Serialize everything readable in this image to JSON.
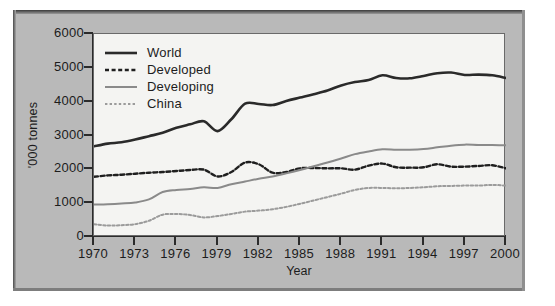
{
  "chart_data": {
    "type": "line",
    "title": "",
    "xlabel": "Year",
    "ylabel": "'000 tonnes",
    "xlim": [
      1970,
      2000
    ],
    "ylim": [
      0,
      6000
    ],
    "grid": false,
    "legend_position": "top-left",
    "x_ticks": [
      "1970",
      "1973",
      "1976",
      "1979",
      "1982",
      "1985",
      "1988",
      "1991",
      "1994",
      "1997",
      "2000"
    ],
    "y_ticks": [
      "0",
      "1000",
      "2000",
      "3000",
      "4000",
      "5000",
      "6000"
    ],
    "x": [
      1970,
      1971,
      1972,
      1973,
      1974,
      1975,
      1976,
      1977,
      1978,
      1979,
      1980,
      1981,
      1982,
      1983,
      1984,
      1985,
      1986,
      1987,
      1988,
      1989,
      1990,
      1991,
      1992,
      1993,
      1994,
      1995,
      1996,
      1997,
      1998,
      1999,
      2000
    ],
    "series": [
      {
        "name": "World",
        "style": "solid",
        "color": "#2a2a2a",
        "width": 2.6,
        "values": [
          2680,
          2760,
          2800,
          2880,
          2980,
          3080,
          3230,
          3330,
          3420,
          3130,
          3480,
          3940,
          3930,
          3900,
          4020,
          4120,
          4220,
          4330,
          4480,
          4580,
          4640,
          4780,
          4700,
          4690,
          4760,
          4840,
          4860,
          4790,
          4800,
          4780,
          4700
        ]
      },
      {
        "name": "Developed",
        "style": "dashed",
        "color": "#1f1f1f",
        "width": 2.4,
        "values": [
          1780,
          1820,
          1840,
          1870,
          1900,
          1920,
          1950,
          1980,
          1990,
          1790,
          1920,
          2200,
          2150,
          1900,
          1920,
          2030,
          2040,
          2030,
          2030,
          1990,
          2110,
          2170,
          2060,
          2050,
          2060,
          2150,
          2080,
          2080,
          2100,
          2120,
          2030
        ]
      },
      {
        "name": "Developing",
        "style": "solid",
        "color": "#8a8a8a",
        "width": 2.0,
        "values": [
          960,
          970,
          990,
          1020,
          1110,
          1330,
          1390,
          1420,
          1470,
          1450,
          1560,
          1640,
          1720,
          1790,
          1880,
          1980,
          2090,
          2200,
          2320,
          2450,
          2530,
          2590,
          2580,
          2580,
          2600,
          2650,
          2700,
          2730,
          2720,
          2720,
          2710
        ]
      },
      {
        "name": "China",
        "style": "dotted",
        "color": "#9b9b9b",
        "width": 2.0,
        "values": [
          380,
          340,
          350,
          380,
          480,
          660,
          680,
          650,
          580,
          620,
          680,
          750,
          780,
          820,
          890,
          980,
          1080,
          1180,
          1280,
          1390,
          1450,
          1450,
          1440,
          1450,
          1470,
          1500,
          1510,
          1520,
          1520,
          1540,
          1520
        ]
      }
    ]
  },
  "legend": {
    "items": [
      {
        "label": "World"
      },
      {
        "label": "Developed"
      },
      {
        "label": "Developing"
      },
      {
        "label": "China"
      }
    ]
  }
}
